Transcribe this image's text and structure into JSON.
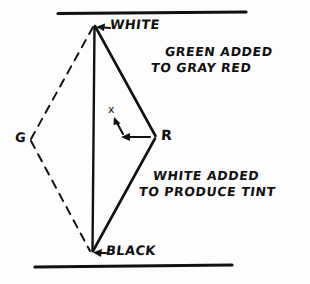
{
  "diagram": {
    "ink_color": "#111111",
    "background_color": "#fdfdfd",
    "vertices": {
      "white": {
        "label": "WHITE",
        "x": 95,
        "y": 25
      },
      "black": {
        "label": "BLACK",
        "x": 92,
        "y": 252
      },
      "red": {
        "label": "R",
        "x": 155,
        "y": 137
      },
      "green": {
        "label": "G",
        "x": 32,
        "y": 140
      }
    },
    "point_marker": {
      "label": "x",
      "x": 113,
      "y": 111
    },
    "rules": {
      "top": {
        "x1": 58,
        "x2": 246,
        "y": 13
      },
      "bottom": {
        "x1": 35,
        "x2": 232,
        "y": 266
      }
    },
    "annotations": [
      {
        "name": "green-added-note",
        "line1": "GREEN ADDED",
        "line2": "TO GRAY RED"
      },
      {
        "name": "white-added-note",
        "line1": "WHITE ADDED",
        "line2": "TO PRODUCE TINT"
      }
    ],
    "labels": {
      "white": "WHITE",
      "black": "BLACK",
      "red": "R",
      "green": "G",
      "point": "x"
    }
  }
}
